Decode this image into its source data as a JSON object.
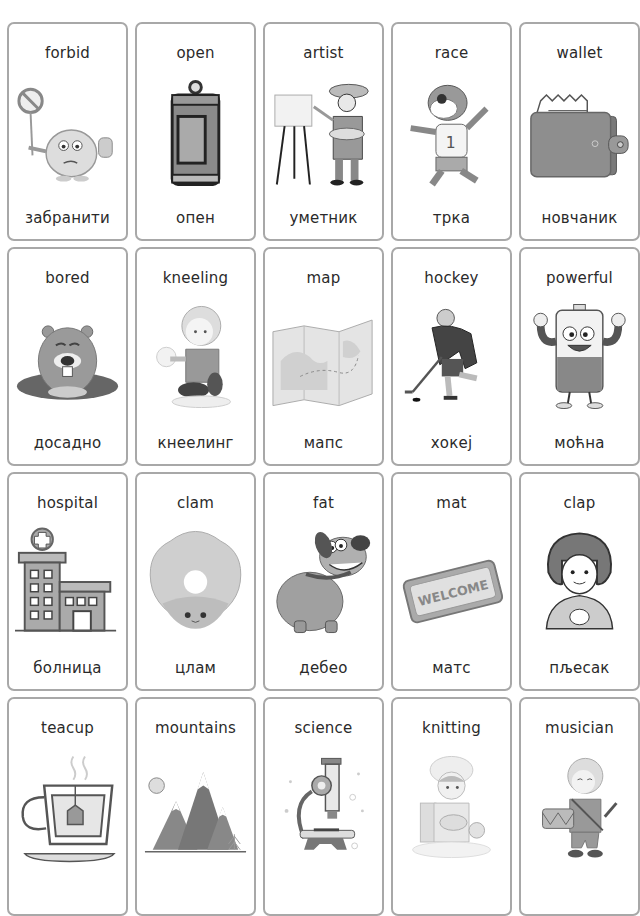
{
  "cards": [
    {
      "en": "forbid",
      "sr": "забранити",
      "icon": "forbid-monster-icon"
    },
    {
      "en": "open",
      "sr": "опен",
      "icon": "soda-can-icon"
    },
    {
      "en": "artist",
      "sr": "уметник",
      "icon": "painter-easel-icon"
    },
    {
      "en": "race",
      "sr": "трка",
      "icon": "running-raccoon-icon"
    },
    {
      "en": "wallet",
      "sr": "новчаник",
      "icon": "wallet-icon"
    },
    {
      "en": "bored",
      "sr": "досадно",
      "icon": "beaver-icon"
    },
    {
      "en": "kneeling",
      "sr": "кнеелинг",
      "icon": "kneeling-boy-icon"
    },
    {
      "en": "map",
      "sr": "мапс",
      "icon": "folded-map-icon"
    },
    {
      "en": "hockey",
      "sr": "хокеј",
      "icon": "hockey-player-icon"
    },
    {
      "en": "powerful",
      "sr": "моћна",
      "icon": "strong-battery-icon"
    },
    {
      "en": "hospital",
      "sr": "болница",
      "icon": "hospital-building-icon"
    },
    {
      "en": "clam",
      "sr": "цлам",
      "icon": "clam-shell-icon"
    },
    {
      "en": "fat",
      "sr": "дебео",
      "icon": "fat-dog-icon"
    },
    {
      "en": "mat",
      "sr": "матс",
      "icon": "welcome-mat-icon"
    },
    {
      "en": "clap",
      "sr": "пљесак",
      "icon": "clapping-girl-icon"
    },
    {
      "en": "teacup",
      "sr": "",
      "icon": "teacup-icon"
    },
    {
      "en": "mountains",
      "sr": "",
      "icon": "mountains-icon"
    },
    {
      "en": "science",
      "sr": "",
      "icon": "microscope-icon"
    },
    {
      "en": "knitting",
      "sr": "",
      "icon": "knitting-girl-icon"
    },
    {
      "en": "musician",
      "sr": "",
      "icon": "drummer-boy-icon"
    }
  ],
  "mat_text": "WELCOME"
}
